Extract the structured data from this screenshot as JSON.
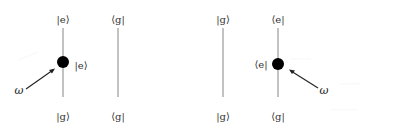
{
  "diagram": {
    "colors": {
      "line": "#999999",
      "dot": "#000000",
      "arrow": "#222222",
      "text": "#333333"
    },
    "left_group": {
      "line1": {
        "top_label": "|e⟩",
        "bottom_label": "|g⟩",
        "dot_label": "|e⟩"
      },
      "line2": {
        "top_label": "⟨g|",
        "bottom_label": "⟨g|"
      },
      "arrow_label": "ω"
    },
    "right_group": {
      "line1": {
        "top_label": "|g⟩",
        "bottom_label": "|g⟩"
      },
      "line2": {
        "top_label": "⟨e|",
        "bottom_label": "⟨g|",
        "dot_label": "⟨e|"
      },
      "arrow_label": "ω"
    }
  }
}
